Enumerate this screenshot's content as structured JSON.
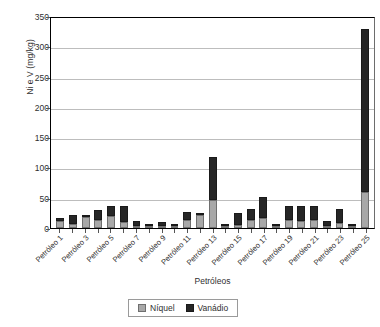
{
  "chart_data": {
    "type": "bar",
    "subtype": "stacked-column",
    "title": "",
    "xlabel": "Petróleos",
    "ylabel": "Ni e V (mg/kg)",
    "ylim": [
      0,
      350
    ],
    "ytick_step": 50,
    "yticks": [
      0,
      50,
      100,
      150,
      200,
      250,
      300,
      350
    ],
    "ytick_labels": [
      "0",
      "50",
      "100",
      "150",
      "200",
      "250",
      "300",
      "350"
    ],
    "grid": true,
    "grid_axis": "y",
    "legend_position": "bottom-center",
    "categories": [
      "Petróleo 1",
      "Petróleo 2",
      "Petróleo 3",
      "Petróleo 4",
      "Petróleo 5",
      "Petróleo 6",
      "Petróleo 7",
      "Petróleo 8",
      "Petróleo 9",
      "Petróleo 10",
      "Petróleo 11",
      "Petróleo 12",
      "Petróleo 13",
      "Petróleo 14",
      "Petróleo 15",
      "Petróleo 16",
      "Petróleo 17",
      "Petróleo 18",
      "Petróleo 19",
      "Petróleo 20",
      "Petróleo 21",
      "Petróleo 22",
      "Petróleo 23",
      "Petróleo 24",
      "Petróleo 25"
    ],
    "tick_labels_shown": [
      "Petróleo 1",
      "",
      "Petróleo 3",
      "",
      "Petróleo 5",
      "",
      "Petróleo 7",
      "",
      "Petróleo 9",
      "",
      "Petróleo 11",
      "",
      "Petróleo 13",
      "",
      "Petróleo 15",
      "",
      "Petróleo 17",
      "",
      "Petróleo 19",
      "",
      "Petróleo 21",
      "",
      "Petróleo 23",
      "",
      "Petróleo 25"
    ],
    "series": [
      {
        "name": "Níquel",
        "color": "#a8a8a8",
        "values": [
          12,
          7,
          18,
          13,
          20,
          10,
          4,
          2,
          3,
          2,
          13,
          21,
          47,
          2,
          5,
          14,
          17,
          4,
          14,
          12,
          13,
          3,
          9,
          2,
          60
        ]
      },
      {
        "name": "Vanádio",
        "color": "#262626",
        "values": [
          5,
          14,
          1,
          17,
          17,
          26,
          8,
          3,
          6,
          3,
          13,
          4,
          71,
          2,
          19,
          17,
          34,
          1,
          23,
          25,
          23,
          9,
          23,
          1,
          268
        ]
      }
    ],
    "totals": [
      17,
      21,
      19,
      30,
      37,
      36,
      12,
      5,
      9,
      5,
      26,
      25,
      118,
      4,
      24,
      31,
      51,
      5,
      37,
      37,
      36,
      12,
      32,
      3,
      328
    ]
  },
  "legend": {
    "items": [
      {
        "label": "Níquel",
        "swatch": "ni-swatch"
      },
      {
        "label": "Vanádio",
        "swatch": "v-swatch"
      }
    ]
  }
}
